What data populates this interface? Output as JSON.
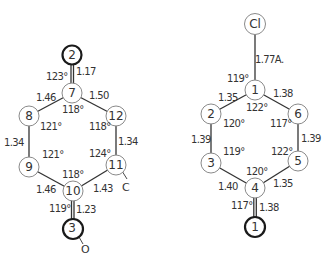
{
  "diagram": {
    "left_molecule": {
      "atoms": [
        {
          "id": "2",
          "label": "2",
          "x": 72,
          "y": 55,
          "bold": true
        },
        {
          "id": "7",
          "label": "7",
          "x": 72,
          "y": 93,
          "bold": false
        },
        {
          "id": "8",
          "label": "8",
          "x": 29,
          "y": 116,
          "bold": false
        },
        {
          "id": "12",
          "label": "12",
          "x": 116,
          "y": 116,
          "bold": false
        },
        {
          "id": "9",
          "label": "9",
          "x": 29,
          "y": 167,
          "bold": false
        },
        {
          "id": "11",
          "label": "11",
          "x": 116,
          "y": 165,
          "bold": false
        },
        {
          "id": "10",
          "label": "10",
          "x": 73,
          "y": 191,
          "bold": false
        },
        {
          "id": "3",
          "label": "3",
          "x": 73,
          "y": 229,
          "bold": true
        }
      ],
      "bond_lengths": {
        "b_2_7": "1.17",
        "b_7_8": "1.46",
        "b_7_12": "1.50",
        "b_8_9": "1.34",
        "b_12_11": "1.34",
        "b_9_10": "1.46",
        "b_11_10": "1.43",
        "b_10_3": "1.23"
      },
      "angles": {
        "a_7_outer": "123°",
        "a_7_inner": "118°",
        "a_8": "121°",
        "a_12": "118°",
        "a_9": "121°",
        "a_11": "124°",
        "a_10_inner": "118°",
        "a_10_outer": "119°"
      },
      "substituents": {
        "c_label": "C",
        "o_label": "O"
      }
    },
    "right_molecule": {
      "atoms": [
        {
          "id": "Cl",
          "label": "Cl",
          "x": 255,
          "y": 24,
          "bold": false
        },
        {
          "id": "1",
          "label": "1",
          "x": 255,
          "y": 90,
          "bold": false
        },
        {
          "id": "2",
          "label": "2",
          "x": 211,
          "y": 114,
          "bold": false
        },
        {
          "id": "6",
          "label": "6",
          "x": 298,
          "y": 114,
          "bold": false
        },
        {
          "id": "3",
          "label": "3",
          "x": 211,
          "y": 163,
          "bold": false
        },
        {
          "id": "5",
          "label": "5",
          "x": 298,
          "y": 161,
          "bold": false
        },
        {
          "id": "4",
          "label": "4",
          "x": 255,
          "y": 188,
          "bold": false
        },
        {
          "id": "1b",
          "label": "1",
          "x": 255,
          "y": 227,
          "bold": true
        }
      ],
      "bond_lengths": {
        "b_cl_1": "1.77A.",
        "b_1_2": "1.35",
        "b_1_6": "1.38",
        "b_2_3": "1.39",
        "b_6_5": "1.39",
        "b_3_4": "1.40",
        "b_5_4": "1.35",
        "b_4_1b": "1.38"
      },
      "angles": {
        "a_1_outer": "119°",
        "a_1_inner": "122°",
        "a_2": "120°",
        "a_6": "117°",
        "a_3": "119°",
        "a_5": "122°",
        "a_4_inner": "120°",
        "a_4_outer": "117°"
      }
    }
  }
}
